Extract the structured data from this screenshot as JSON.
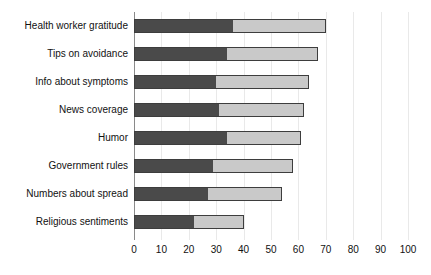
{
  "chart_data": {
    "type": "bar",
    "orientation": "horizontal",
    "stacked": true,
    "title": "",
    "xlabel": "",
    "ylabel": "",
    "xlim": [
      0,
      100
    ],
    "xticks": [
      0,
      10,
      20,
      30,
      40,
      50,
      60,
      70,
      80,
      90,
      100
    ],
    "grid": true,
    "legend": "none",
    "categories": [
      "Health worker gratitude",
      "Tips on avoidance",
      "Info about symptoms",
      "News coverage",
      "Humor",
      "Government rules",
      "Numbers about spread",
      "Religious sentiments"
    ],
    "series": [
      {
        "name": "segment-1",
        "color": "#4a4a4a",
        "values": [
          36,
          34,
          30,
          31,
          34,
          29,
          27,
          22
        ]
      },
      {
        "name": "segment-2",
        "color": "#c9c9c9",
        "values": [
          34,
          33,
          34,
          31,
          27,
          29,
          27,
          18
        ]
      }
    ],
    "totals": [
      70,
      67,
      64,
      62,
      61,
      58,
      54,
      40
    ]
  },
  "style": {
    "bar_dark": "#4a4a4a",
    "bar_light": "#c9c9c9",
    "bar_outline": "#3d3d3d",
    "grid_color": "#e9e9e9",
    "axis_color": "#8a8a8a",
    "background": "#ffffff",
    "text_color": "#111111"
  }
}
